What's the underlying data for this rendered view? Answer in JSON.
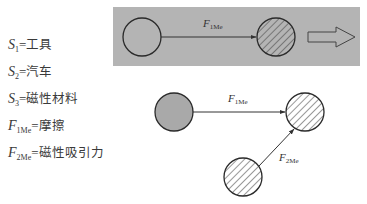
{
  "legend": [
    {
      "symbol": "S",
      "sub": "1",
      "eq": "=",
      "meaning": "工具"
    },
    {
      "symbol": "S",
      "sub": "2",
      "eq": "=",
      "meaning": "汽车"
    },
    {
      "symbol": "S",
      "sub": "3",
      "eq": "=",
      "meaning": "磁性材料"
    },
    {
      "symbol": "F",
      "sub": "1Me",
      "eq": "=",
      "meaning": "摩擦"
    },
    {
      "symbol": "F",
      "sub": "2Me",
      "eq": "=",
      "meaning": "磁性吸引力"
    }
  ],
  "top_panel": {
    "force_label": {
      "symbol": "F",
      "sub": "1Me"
    },
    "colors": {
      "background": "#b4b4b4",
      "stroke": "#2a2a2a"
    }
  },
  "bottom_panel": {
    "force1_label": {
      "symbol": "F",
      "sub": "1Me"
    },
    "force2_label": {
      "symbol": "F",
      "sub": "2Me"
    },
    "colors": {
      "tool_fill": "#a9a9a9",
      "stroke": "#2a2a2a"
    }
  }
}
